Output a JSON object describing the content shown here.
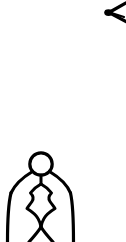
{
  "canvas": {
    "width": 126,
    "height": 242,
    "background_color": "#ffffff",
    "ink_color": "#000000",
    "title": "Line Drawing"
  },
  "artwork": {
    "style": "black ink line drawing on white background",
    "elements": [
      {
        "name": "chevron-mark",
        "description": "partial chevron pointing left with a thick dot at its vertex, cropped by the top-right image edge",
        "color": "#000000",
        "stroke_width": 3.4,
        "bounds": {
          "x": 104,
          "y": 2,
          "width": 22,
          "height": 22
        }
      },
      {
        "name": "figure",
        "description": "standing figure with round head, bell-shaped cloak body, inner leaf motif and crossing legs cropped at the bottom edge",
        "color": "#000000",
        "stroke_width": 3.2,
        "bounds": {
          "x": 6,
          "y": 152,
          "width": 68,
          "height": 90
        },
        "parts": [
          {
            "name": "head",
            "shape": "circle",
            "cx": 41,
            "cy": 164,
            "r": 11.5
          },
          {
            "name": "shoulders",
            "shape": "curve"
          },
          {
            "name": "cloak-outline",
            "shape": "bell"
          },
          {
            "name": "inner-leaf",
            "shape": "pointed-diamond"
          },
          {
            "name": "legs",
            "shape": "inverted-v"
          }
        ]
      }
    ]
  }
}
